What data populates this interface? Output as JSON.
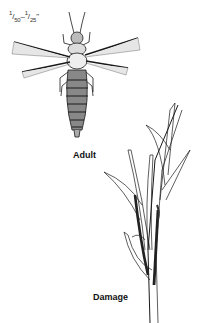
{
  "figure": {
    "size_label": {
      "from_num": "1",
      "from_den": "50",
      "to_num": "1",
      "to_den": "25",
      "unit": "\""
    },
    "captions": {
      "adult": "Adult",
      "damage": "Damage"
    },
    "illustrations": {
      "insect": "thrips-adult",
      "plant": "damaged-grass-stems"
    },
    "ink_color": "#1a1a1a"
  }
}
